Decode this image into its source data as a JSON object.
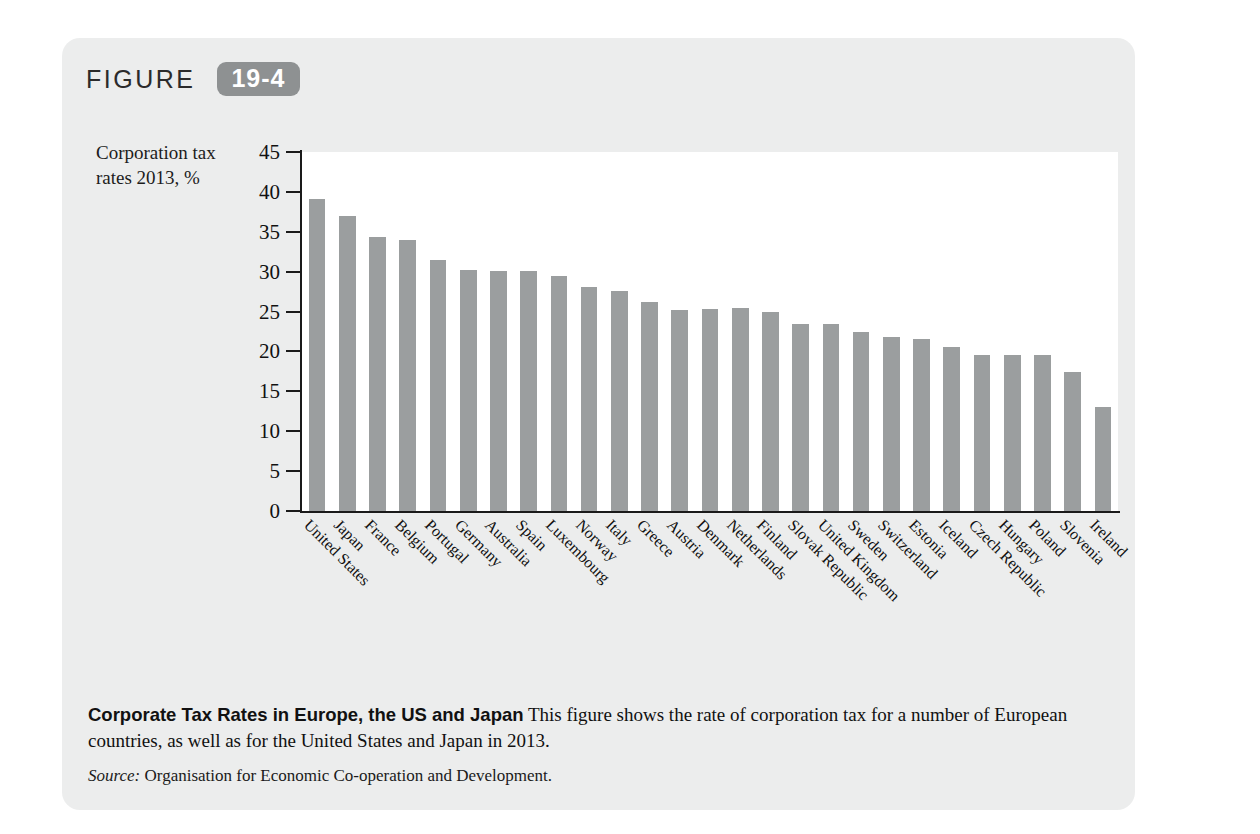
{
  "figure": {
    "word": "FIGURE",
    "number": "19-4"
  },
  "axis": {
    "y_title_line1": "Corporation tax",
    "y_title_line2": "rates 2013, %",
    "y_ticks": [
      "0",
      "5",
      "10",
      "15",
      "20",
      "25",
      "30",
      "35",
      "40",
      "45"
    ]
  },
  "caption": {
    "title": "Corporate Tax Rates in Europe, the US and Japan",
    "body": "This figure shows the rate of corporation tax for a number of European countries, as well as for the United States and Japan in 2013.",
    "source_label": "Source:",
    "source_text": "Organisation for Economic Co-operation and Development."
  },
  "colors": {
    "panel": "#eceded",
    "bar": "#9b9e9f",
    "badge": "#8e9192",
    "axis": "#1a1a1a",
    "plot_bg": "#ffffff"
  },
  "chart_data": {
    "type": "bar",
    "title": "Corporate Tax Rates in Europe, the US and Japan",
    "xlabel": "",
    "ylabel": "Corporation tax rates 2013, %",
    "ylim": [
      0,
      45
    ],
    "ytick_step": 5,
    "grid": false,
    "legend": "none",
    "categories": [
      "United States",
      "Japan",
      "France",
      "Belgium",
      "Portugal",
      "Germany",
      "Australia",
      "Spain",
      "Luxembourg",
      "Norway",
      "Italy",
      "Greece",
      "Austria",
      "Denmark",
      "Netherlands",
      "Finland",
      "Slovak Republic",
      "United Kingdom",
      "Sweden",
      "Switzerland",
      "Estonia",
      "Iceland",
      "Czech Republic",
      "Hungary",
      "Poland",
      "Slovenia",
      "Ireland"
    ],
    "values": [
      39.1,
      37.0,
      34.4,
      34.0,
      31.5,
      30.2,
      30.1,
      30.1,
      29.4,
      28.1,
      27.6,
      26.2,
      25.2,
      25.3,
      25.4,
      24.9,
      23.4,
      23.5,
      22.5,
      21.8,
      21.6,
      20.6,
      19.6,
      19.6,
      19.6,
      17.4,
      13.1
    ]
  }
}
